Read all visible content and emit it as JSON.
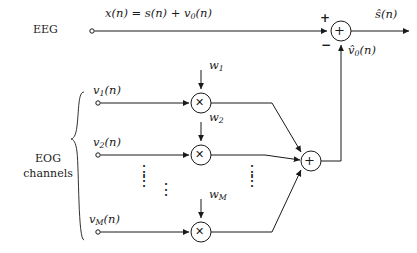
{
  "diagram": {
    "primary_input": {
      "group_label": "EEG",
      "signal_equation": "x(n) = s(n) + v",
      "signal_equation_sub": "0",
      "signal_equation_tail": "(n)"
    },
    "reference_inputs": {
      "group_label_line1": "EOG",
      "group_label_line2": "channels",
      "channels": [
        {
          "name": "v",
          "sub": "1",
          "tail": "(n)",
          "weight": "w",
          "weight_sub": "1",
          "y": 103
        },
        {
          "name": "v",
          "sub": "2",
          "tail": "(n)",
          "weight": "w",
          "weight_sub": "2",
          "y": 155
        },
        {
          "name": "v",
          "sub": "M",
          "tail": "(n)",
          "weight": "w",
          "weight_sub": "M",
          "y": 232
        }
      ],
      "ellipsis_glyph": "⋮"
    },
    "nodes": {
      "output_summer": {
        "glyph": "+",
        "plus_sign": "+",
        "minus_sign": "−"
      },
      "weight_summer": {
        "glyph": "+"
      },
      "multiplier": {
        "glyph": "✕"
      }
    },
    "signals": {
      "estimated_noise": "v̂",
      "estimated_noise_sub": "0",
      "estimated_noise_tail": "(n)",
      "output": "ŝ",
      "output_tail": "(n)"
    },
    "colors": {
      "line": "#1a1a1a",
      "background": "#ffffff",
      "text": "#1a1a1a"
    }
  }
}
